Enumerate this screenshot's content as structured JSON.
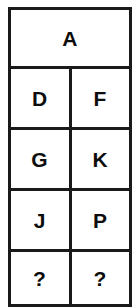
{
  "puzzle": {
    "type": "letter-sequence-grid",
    "border_color": "#1a1a1a",
    "text_color": "#0d0d0d",
    "background_color": "#ffffff",
    "header": {
      "label": "A",
      "colspan": 2
    },
    "rows": [
      {
        "left": "D",
        "right": "F"
      },
      {
        "left": "G",
        "right": "K"
      },
      {
        "left": "J",
        "right": "P"
      },
      {
        "left": "?",
        "right": "?"
      }
    ]
  }
}
